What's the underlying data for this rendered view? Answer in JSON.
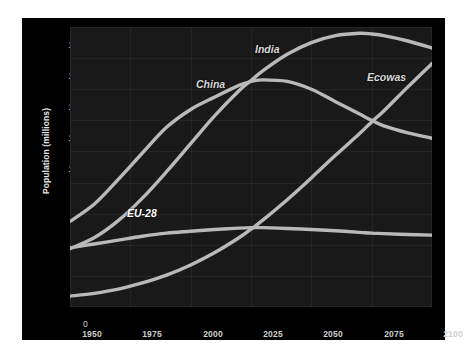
{
  "chart_data": {
    "type": "line",
    "title": "",
    "xlabel": "Year",
    "ylabel": "Population  (millions)",
    "xlim": [
      1950,
      2100
    ],
    "ylim": [
      0,
      1800
    ],
    "xticks": [
      1950,
      1975,
      2000,
      2025,
      2050,
      2075,
      2100
    ],
    "yticks": [
      0,
      200,
      400,
      600,
      800,
      1000,
      1200,
      1400,
      1600,
      1800
    ],
    "grid": true,
    "legend": "inline-labels",
    "background_color": "#191919",
    "line_color": "#b9b9b9",
    "x": [
      1950,
      1960,
      1970,
      1980,
      1990,
      2000,
      2010,
      2020,
      2025,
      2030,
      2040,
      2050,
      2060,
      2070,
      2075,
      2080,
      2090,
      2100
    ],
    "series": [
      {
        "name": "China",
        "values": [
          550,
          660,
          820,
          990,
          1155,
          1270,
          1350,
          1425,
          1450,
          1460,
          1450,
          1400,
          1320,
          1240,
          1200,
          1165,
          1120,
          1085
        ]
      },
      {
        "name": "India",
        "values": [
          375,
          445,
          555,
          700,
          870,
          1050,
          1230,
          1390,
          1455,
          1520,
          1625,
          1700,
          1745,
          1760,
          1755,
          1745,
          1710,
          1665
        ]
      },
      {
        "name": "EU-28",
        "values": [
          380,
          405,
          430,
          455,
          475,
          487,
          498,
          507,
          510,
          510,
          505,
          498,
          490,
          480,
          475,
          472,
          466,
          462
        ]
      },
      {
        "name": "Ecowas",
        "values": [
          70,
          88,
          115,
          155,
          205,
          270,
          350,
          445,
          500,
          560,
          690,
          830,
          975,
          1115,
          1190,
          1260,
          1415,
          1565
        ]
      }
    ],
    "series_labels": [
      {
        "name": "India",
        "text": "India"
      },
      {
        "name": "China",
        "text": "China"
      },
      {
        "name": "Ecowas",
        "text": "Ecowas"
      },
      {
        "name": "EU-28",
        "text": "EU-28"
      }
    ]
  }
}
